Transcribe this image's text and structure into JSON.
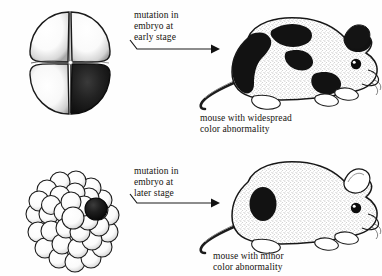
{
  "figure": {
    "background_color": "#fefefe",
    "ink_color": "#15130f"
  },
  "panels": [
    {
      "id": "early",
      "embryo_label": "mutation in\nembryo at\nearly stage",
      "embryo_stage_name": "four-cell embryo",
      "mutant_cell_count": 1,
      "total_cell_count": 4,
      "mouse_caption": "mouse with widespread\ncolor abnormality",
      "patch_description": "large black patches over back, flank, shoulder and tail base"
    },
    {
      "id": "later",
      "embryo_label": "mutation in\nembryo at\nlater stage",
      "embryo_stage_name": "morula",
      "mutant_cell_count": 1,
      "total_cell_count": 40,
      "mouse_caption": "mouse with minor\ncolor abnormality",
      "patch_description": "single small black oval spot on the haunch"
    }
  ],
  "arrows": {
    "early": {
      "name": "arrow-early-stage",
      "direction": "left-to-right"
    },
    "later": {
      "name": "arrow-later-stage",
      "direction": "left-to-right"
    }
  },
  "colors": {
    "mutant_cell": "#151515",
    "normal_cell": "#ffffff",
    "outline": "#1a1a1a",
    "fur_shade": "#7a7a7a"
  }
}
